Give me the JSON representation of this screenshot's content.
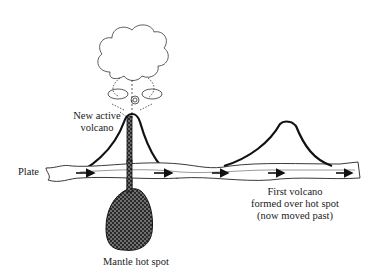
{
  "diagram": {
    "type": "hotspot-volcanism",
    "labels": {
      "new_volcano_line1": "New active",
      "new_volcano_line2": "volcano",
      "plate": "Plate",
      "hotspot": "Mantle hot spot",
      "first_volcano_line1": "First volcano",
      "first_volcano_line2": "formed over  hot spot",
      "first_volcano_line3": "(now moved past)"
    },
    "elements": [
      "eruption-cloud",
      "new-volcano",
      "magma-conduit",
      "mantle-hot-spot",
      "plate",
      "plate-motion-arrows",
      "old-volcano"
    ],
    "arrow_direction": "right",
    "arrow_count": 5,
    "colors": {
      "line": "#111111",
      "background": "#ffffff"
    }
  }
}
